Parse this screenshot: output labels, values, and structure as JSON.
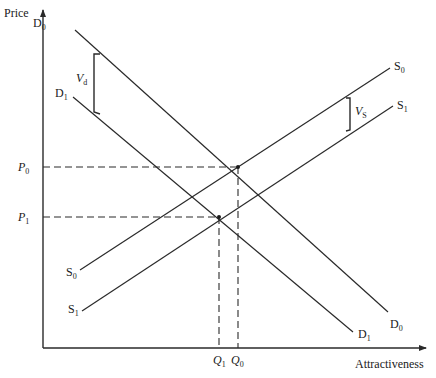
{
  "axes": {
    "y_label": "Price",
    "x_label": "Attractiveness"
  },
  "curves": {
    "D0": {
      "label": "D",
      "sub": "0"
    },
    "D1": {
      "label": "D",
      "sub": "1"
    },
    "S0": {
      "label": "S",
      "sub": "0"
    },
    "S1": {
      "label": "S",
      "sub": "1"
    }
  },
  "shifts": {
    "Vd": {
      "label": "V",
      "sub": "d"
    },
    "Vs": {
      "label": "V",
      "sub": "S"
    }
  },
  "equilibria": {
    "P0": {
      "label": "P",
      "sub": "0"
    },
    "P1": {
      "label": "P",
      "sub": "1"
    },
    "Q0": {
      "label": "Q",
      "sub": "0"
    },
    "Q1": {
      "label": "Q",
      "sub": "1"
    }
  },
  "colors": {
    "line": "#2a2a2a",
    "background": "#ffffff"
  }
}
